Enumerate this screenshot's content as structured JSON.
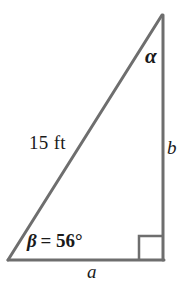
{
  "figure": {
    "kind": "right-triangle-diagram",
    "background_color": "#ffffff",
    "stroke_color": "#6e6e6e",
    "text_color": "#1a1a1a",
    "stroke_width": 3
  },
  "geometry": {
    "vertices": {
      "bottom_left": {
        "x": 8,
        "y": 260
      },
      "bottom_right": {
        "x": 163,
        "y": 260
      },
      "apex_top": {
        "x": 162,
        "y": 15
      }
    },
    "right_angle_marker": {
      "corner": "bottom-right",
      "size": 24,
      "x": 139,
      "y": 236
    }
  },
  "labels": {
    "hypotenuse": "15 ft",
    "angle_beta_symbol": "β",
    "angle_beta_value": "= 56°",
    "angle_beta_full": "β = 56°",
    "angle_alpha": "α",
    "side_b": "b",
    "side_a": "a"
  },
  "measurements": {
    "hypotenuse_length": 15,
    "hypotenuse_units": "ft",
    "angle_beta_degrees": 56,
    "angle_alpha_degrees": null,
    "side_a_length": null,
    "side_b_length": null
  }
}
